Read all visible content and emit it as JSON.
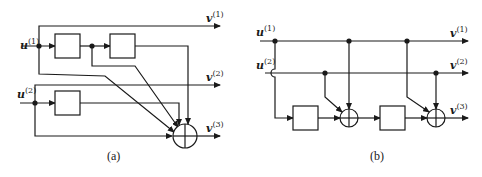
{
  "figure": {
    "panels": [
      {
        "id": "a",
        "caption": "(a)",
        "inputs": [
          {
            "name": "u",
            "index": "(1)"
          },
          {
            "name": "u",
            "index": "(2)"
          }
        ],
        "outputs": [
          {
            "name": "v",
            "index": "(1)"
          },
          {
            "name": "v",
            "index": "(2)"
          },
          {
            "name": "v",
            "index": "(3)"
          }
        ],
        "delay_elements": 3,
        "adders": 1
      },
      {
        "id": "b",
        "caption": "(b)",
        "inputs": [
          {
            "name": "u",
            "index": "(1)"
          },
          {
            "name": "u",
            "index": "(2)"
          }
        ],
        "outputs": [
          {
            "name": "v",
            "index": "(1)"
          },
          {
            "name": "v",
            "index": "(2)"
          },
          {
            "name": "v",
            "index": "(3)"
          }
        ],
        "delay_elements": 2,
        "adders": 2
      }
    ]
  },
  "colors": {
    "stroke": "#1a1a1a",
    "background": "#ffffff"
  }
}
